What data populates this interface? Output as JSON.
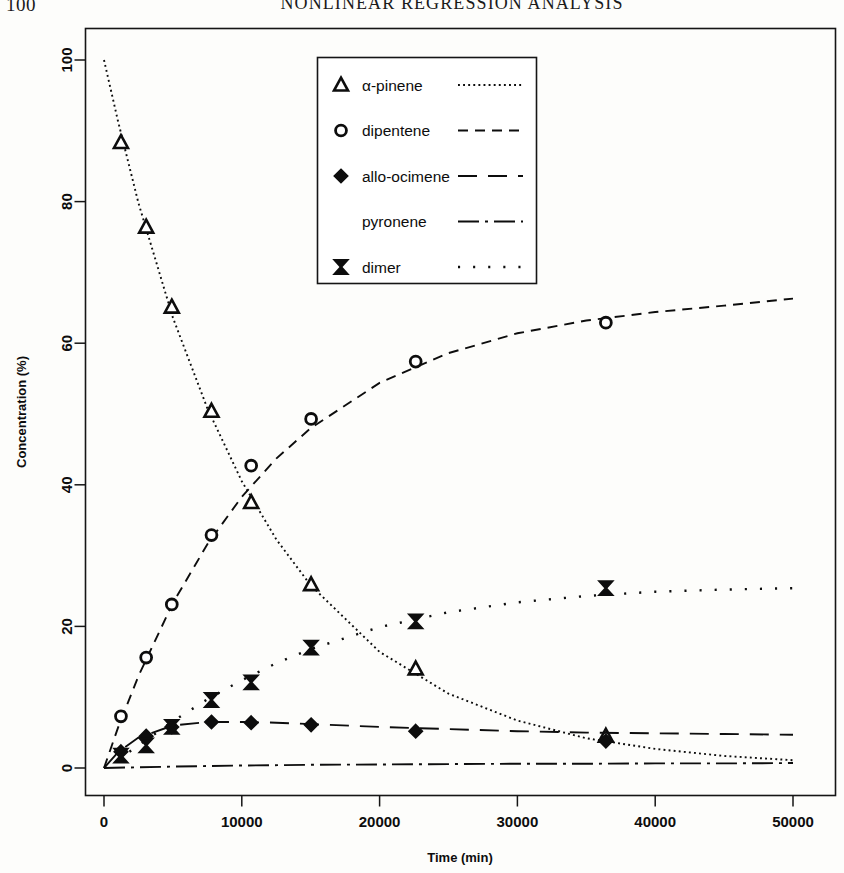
{
  "page": {
    "number": "100",
    "running_head": "NONLINEAR REGRESSION ANALYSIS"
  },
  "chart_data": {
    "type": "scatter",
    "title": "",
    "xlabel": "Time (min)",
    "ylabel": "Concentration (%)",
    "xlim": [
      -1800,
      52000
    ],
    "ylim": [
      -3,
      104
    ],
    "xticks": [
      0,
      10000,
      20000,
      30000,
      40000,
      50000
    ],
    "xtick_labels": [
      "0",
      "10000",
      "20000",
      "30000",
      "40000",
      "50000"
    ],
    "yticks": [
      0,
      20,
      40,
      60,
      80,
      100
    ],
    "ytick_labels": [
      "0",
      "20",
      "40",
      "60",
      "80",
      "100"
    ],
    "grid": false,
    "legend_position": "top-center",
    "series": [
      {
        "name": "α-pinene",
        "marker": "triangle-open",
        "linestyle": "dotted",
        "x": [
          1230,
          3060,
          4920,
          7800,
          10680,
          15030,
          22620,
          36420
        ],
        "y": [
          88.35,
          76.4,
          65.1,
          50.4,
          37.5,
          25.9,
          14.0,
          4.5
        ],
        "fit_x": [
          0,
          1000,
          2500,
          5000,
          7500,
          10000,
          12500,
          15000,
          20000,
          25000,
          30000,
          35000,
          40000,
          45000,
          50000
        ],
        "fit_y": [
          100.0,
          91.5,
          79.8,
          63.6,
          50.8,
          40.5,
          32.3,
          25.8,
          16.4,
          10.5,
          6.7,
          4.2,
          2.7,
          1.7,
          1.1
        ]
      },
      {
        "name": "dipentene",
        "marker": "circle-open",
        "linestyle": "dashed",
        "x": [
          1230,
          3060,
          4920,
          7800,
          10680,
          15030,
          22620,
          36420
        ],
        "y": [
          7.3,
          15.6,
          23.1,
          32.9,
          42.7,
          49.3,
          57.4,
          62.9
        ],
        "fit_x": [
          0,
          1000,
          2500,
          5000,
          7500,
          10000,
          12500,
          15000,
          20000,
          25000,
          30000,
          35000,
          40000,
          45000,
          50000
        ],
        "fit_y": [
          0.0,
          5.6,
          13.0,
          23.3,
          31.6,
          38.3,
          43.7,
          48.0,
          54.4,
          58.6,
          61.4,
          63.2,
          64.4,
          65.3,
          66.3
        ]
      },
      {
        "name": "allo-ocimene",
        "marker": "diamond-filled",
        "linestyle": "long-dash",
        "x": [
          1230,
          3060,
          4920,
          7800,
          10680,
          15030,
          22620,
          36420
        ],
        "y": [
          2.3,
          4.5,
          5.8,
          6.5,
          6.4,
          6.1,
          5.2,
          3.8
        ],
        "fit_x": [
          0,
          1000,
          2500,
          5000,
          7500,
          10000,
          12500,
          15000,
          20000,
          25000,
          30000,
          35000,
          40000,
          45000,
          50000
        ],
        "fit_y": [
          0.0,
          2.2,
          4.3,
          6.0,
          6.5,
          6.5,
          6.4,
          6.2,
          5.8,
          5.5,
          5.2,
          5.0,
          4.9,
          4.8,
          4.7
        ]
      },
      {
        "name": "pyronene",
        "marker": "none",
        "linestyle": "dash-dot",
        "x": [],
        "y": [],
        "fit_x": [
          0,
          5000,
          10000,
          15000,
          20000,
          25000,
          30000,
          35000,
          40000,
          45000,
          50000
        ],
        "fit_y": [
          0.0,
          0.2,
          0.35,
          0.45,
          0.5,
          0.55,
          0.6,
          0.6,
          0.65,
          0.65,
          0.7
        ]
      },
      {
        "name": "dimer",
        "marker": "bowtie",
        "linestyle": "sparse-dotted",
        "x": [
          1230,
          3060,
          4920,
          7800,
          10680,
          15030,
          22620,
          36420
        ],
        "y": [
          1.75,
          3.2,
          5.8,
          9.6,
          12.1,
          17.0,
          20.7,
          25.4
        ],
        "fit_x": [
          0,
          1000,
          2500,
          5000,
          7500,
          10000,
          12500,
          15000,
          20000,
          25000,
          30000,
          35000,
          40000,
          45000,
          50000
        ],
        "fit_y": [
          0.0,
          1.1,
          3.2,
          6.6,
          9.7,
          12.4,
          14.8,
          16.8,
          19.9,
          22.0,
          23.4,
          24.3,
          24.9,
          25.2,
          25.4
        ]
      }
    ]
  },
  "legend": {
    "items": [
      {
        "label": "α-pinene",
        "marker": "triangle-open",
        "dash": "dotted"
      },
      {
        "label": "dipentene",
        "marker": "circle-open",
        "dash": "dashed"
      },
      {
        "label": "allo-ocimene",
        "marker": "diamond-filled",
        "dash": "long-dash"
      },
      {
        "label": "pyronene",
        "marker": "none",
        "dash": "dash-dot"
      },
      {
        "label": "dimer",
        "marker": "bowtie",
        "dash": "sparse-dotted"
      }
    ]
  },
  "colors": {
    "ink": "#0d0d0d",
    "paper": "#fdfdfb"
  }
}
